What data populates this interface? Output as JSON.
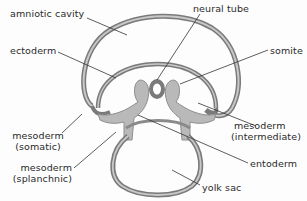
{
  "diagram": {
    "title": "",
    "colors": {
      "membrane_outer": "#7a7a7a",
      "membrane_inner": "#b4b4b4",
      "mesoderm_fill": "#b9b9b9",
      "cavity_fill": "#ffffff",
      "leader_line": "#333333",
      "text": "#2a2a2a"
    },
    "labels": {
      "amniotic_cavity": "amniotic cavity",
      "ectoderm": "ectoderm",
      "neural_tube": "neural tube",
      "somite": "somite",
      "mesoderm_somatic_1": "mesoderm",
      "mesoderm_somatic_2": "(somatic)",
      "mesoderm_splanchnic_1": "mesoderm",
      "mesoderm_splanchnic_2": "(splanchnic)",
      "mesoderm_intermediate_1": "mesoderm",
      "mesoderm_intermediate_2": "(intermediate)",
      "entoderm": "entoderm",
      "yolk_sac": "yolk sac"
    }
  }
}
